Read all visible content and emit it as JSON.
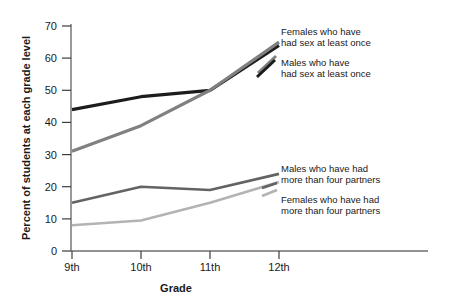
{
  "chart_data": {
    "type": "line",
    "title": "",
    "xlabel": "Grade",
    "ylabel": "Percent of students at each grade level",
    "categories": [
      "9th",
      "10th",
      "11th",
      "12th"
    ],
    "xticklabels": [
      "9th",
      "10th",
      "11th",
      "12th"
    ],
    "yticklabels": [
      "0",
      "10",
      "20",
      "30",
      "40",
      "50",
      "60",
      "70"
    ],
    "ytickvalues": [
      0,
      10,
      20,
      30,
      40,
      50,
      60,
      70
    ],
    "ylim": [
      0,
      73
    ],
    "grid": false,
    "legend_position": "inline-annotations",
    "series": [
      {
        "name": "Males who have had sex at least once",
        "values": [
          44,
          48,
          50,
          64
        ],
        "color": "#1c1c1c"
      },
      {
        "name": "Females who have had sex at least once",
        "values": [
          31,
          39,
          50,
          65
        ],
        "color": "#808080"
      },
      {
        "name": "Males who have had more than four partners",
        "values": [
          15,
          20,
          19,
          24
        ],
        "color": "#636363"
      },
      {
        "name": "Females who have had more than four partners",
        "values": [
          8,
          9.5,
          15,
          21.5
        ],
        "color": "#b3b3b3"
      }
    ],
    "annotations": [
      {
        "id": "annotation-females-sex",
        "line1": "Females who have",
        "line2": "had sex at least once"
      },
      {
        "id": "annotation-males-sex",
        "line1": "Males who have",
        "line2": "had sex at least once"
      },
      {
        "id": "annotation-males-partners",
        "line1": "Males who have had",
        "line2": "more than four partners"
      },
      {
        "id": "annotation-females-partners",
        "line1": "Females who have had",
        "line2": "more than four partners"
      }
    ]
  }
}
